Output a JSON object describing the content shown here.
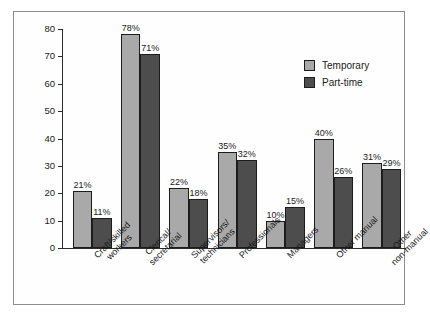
{
  "chart_data": {
    "type": "bar",
    "title": "",
    "xlabel": "",
    "ylabel": "",
    "ylim": [
      0,
      80
    ],
    "yticks": [
      0,
      10,
      20,
      30,
      40,
      50,
      60,
      70,
      80
    ],
    "grid": false,
    "legend_position": "top-right",
    "value_suffix": "%",
    "categories": [
      "Craft/skilled workers",
      "Clerical/secretarial",
      "Supervisors/technicians",
      "Professionals",
      "Managers",
      "Other manual",
      "Other non-manual"
    ],
    "category_lines": [
      [
        "Craft/skilled",
        "workers"
      ],
      [
        "Clerical/",
        "secretarial"
      ],
      [
        "Supervisors/",
        "technicians"
      ],
      [
        "Professionals"
      ],
      [
        "Managers"
      ],
      [
        "Other manual"
      ],
      [
        "Other",
        "non-manual"
      ]
    ],
    "series": [
      {
        "name": "Temporary",
        "color": "#a9a9a9",
        "values": [
          21,
          78,
          22,
          35,
          10,
          40,
          31
        ],
        "labels": [
          "21%",
          "78%",
          "22%",
          "35%",
          "10%",
          "40%",
          "31%"
        ]
      },
      {
        "name": "Part-time",
        "color": "#4d4d4d",
        "values": [
          11,
          71,
          18,
          32,
          15,
          26,
          29
        ],
        "labels": [
          "11%",
          "71%",
          "18%",
          "32%",
          "15%",
          "26%",
          "29%"
        ]
      }
    ]
  },
  "axis": {
    "tick_labels": [
      "80",
      "70",
      "60",
      "50",
      "40",
      "30",
      "20",
      "10",
      "0"
    ]
  },
  "legend": {
    "items": [
      {
        "label": "Temporary",
        "swatch": "temp"
      },
      {
        "label": "Part-time",
        "swatch": "part"
      }
    ]
  },
  "colors": {
    "temporary": "#a9a9a9",
    "part_time": "#4d4d4d",
    "axis": "#2b2b2b",
    "frame": "#8d8d8d",
    "background": "#fefefe"
  }
}
